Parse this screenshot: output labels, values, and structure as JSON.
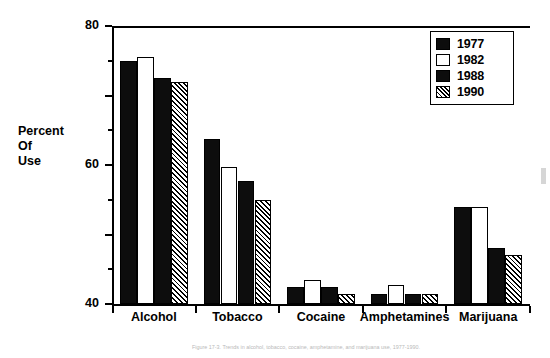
{
  "chart_data": {
    "type": "bar",
    "title": "",
    "xlabel": "",
    "ylabel": "Percent Of Use",
    "ylabel_lines": [
      "Percent",
      "Of",
      "Use"
    ],
    "ylim": [
      0,
      80
    ],
    "yticks": [
      0,
      20,
      40,
      60,
      80
    ],
    "ytick_labels": [
      "0",
      "20",
      "40",
      "60",
      "80"
    ],
    "yminor_ticks": [
      10,
      30,
      50,
      70
    ],
    "grid": false,
    "legend_position": "top-right",
    "categories": [
      "Alcohol",
      "Tobacco",
      "Cocaine",
      "Amphetamines",
      "Marijuana"
    ],
    "series": [
      {
        "name": "1977",
        "fill": "solid",
        "values": [
          70,
          47.5,
          5,
          3,
          28
        ]
      },
      {
        "name": "1982",
        "fill": "open",
        "values": [
          71,
          39.5,
          7,
          5.5,
          28
        ]
      },
      {
        "name": "1988",
        "fill": "solid",
        "values": [
          65,
          35.5,
          5,
          3,
          16
        ]
      },
      {
        "name": "1990",
        "fill": "hatch",
        "values": [
          64,
          30,
          3,
          3,
          14
        ]
      }
    ]
  },
  "legend": {
    "items": [
      {
        "label": "1977",
        "fill": "solid"
      },
      {
        "label": "1982",
        "fill": "open"
      },
      {
        "label": "1988",
        "fill": "solid"
      },
      {
        "label": "1990",
        "fill": "hatch"
      }
    ]
  },
  "caption": {
    "text": "Figure 17-3. Trends in alcohol, tobacco, cocaine, amphetamine, and marijuana use, 1977-1990."
  },
  "colors": {
    "ink": "#000000",
    "solid_fill": "#0d0d0d",
    "open_fill": "#ffffff",
    "background": "#ffffff"
  }
}
